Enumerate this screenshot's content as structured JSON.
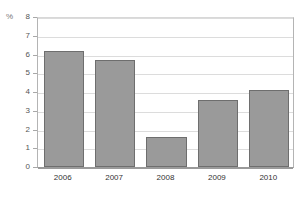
{
  "title_strip": "",
  "axis": {
    "unit_label": "%",
    "y_ticks": [
      "8",
      "7",
      "6",
      "5",
      "4",
      "3",
      "2",
      "1",
      "0"
    ]
  },
  "colors": {
    "bar_fill": "#9a9a9a",
    "bar_border": "#6e6e6e",
    "gridline": "#dcdcdc",
    "axis": "#9a9a9a",
    "background": "#ffffff"
  },
  "chart_data": {
    "type": "bar",
    "title": "",
    "xlabel": "",
    "ylabel": "%",
    "ylim": [
      0,
      8
    ],
    "ytick_step": 1,
    "grid": true,
    "legend": false,
    "categories": [
      "2006",
      "2007",
      "2008",
      "2009",
      "2010"
    ],
    "values": [
      6.2,
      5.7,
      1.6,
      3.6,
      4.1
    ],
    "series": [
      {
        "name": "",
        "values": [
          6.2,
          5.7,
          1.6,
          3.6,
          4.1
        ]
      }
    ]
  }
}
